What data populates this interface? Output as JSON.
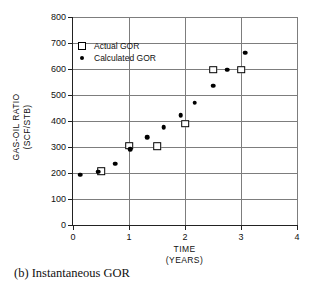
{
  "figure": {
    "caption": "(b)  Instantaneous GOR"
  },
  "legend": {
    "position": "inside-top-left",
    "entries": [
      {
        "label": "Actual GOR",
        "marker": "open-square"
      },
      {
        "label": "Calculated GOR",
        "marker": "filled-circle"
      }
    ]
  },
  "axes": {
    "x_title_line1": "TIME",
    "x_title_line2": "(YEARS)",
    "y_title_line1": "GAS-OIL RATIO",
    "y_title_line2": "(SCF/STB)",
    "x_ticks": [
      "0",
      "1",
      "2",
      "3",
      "4"
    ],
    "y_ticks": [
      "0",
      "100",
      "200",
      "300",
      "400",
      "500",
      "600",
      "700",
      "800"
    ]
  },
  "chart_data": {
    "type": "scatter",
    "title": "(b)  Instantaneous GOR",
    "xlabel": "TIME (YEARS)",
    "ylabel": "GAS-OIL RATIO (SCF/STB)",
    "xlim": [
      0,
      4
    ],
    "ylim": [
      0,
      800
    ],
    "xticks": [
      0,
      1,
      2,
      3,
      4
    ],
    "yticks": [
      0,
      100,
      200,
      300,
      400,
      500,
      600,
      700,
      800
    ],
    "grid": true,
    "legend_position": "inside-top-left",
    "series": [
      {
        "name": "Actual GOR",
        "marker": "open-square",
        "color": "#000000",
        "points": [
          {
            "x": 0.5,
            "y": 208
          },
          {
            "x": 1.0,
            "y": 305
          },
          {
            "x": 1.5,
            "y": 303
          },
          {
            "x": 2.0,
            "y": 390
          },
          {
            "x": 2.5,
            "y": 598
          },
          {
            "x": 3.0,
            "y": 598
          }
        ]
      },
      {
        "name": "Calculated GOR",
        "marker": "filled-circle",
        "color": "#000000",
        "points": [
          {
            "x": 0.13,
            "y": 194
          },
          {
            "x": 0.45,
            "y": 205
          },
          {
            "x": 0.75,
            "y": 235
          },
          {
            "x": 1.02,
            "y": 292
          },
          {
            "x": 1.32,
            "y": 337
          },
          {
            "x": 1.62,
            "y": 376
          },
          {
            "x": 1.92,
            "y": 422
          },
          {
            "x": 2.17,
            "y": 470
          },
          {
            "x": 2.5,
            "y": 535
          },
          {
            "x": 2.75,
            "y": 598
          },
          {
            "x": 3.07,
            "y": 663
          }
        ]
      }
    ]
  }
}
